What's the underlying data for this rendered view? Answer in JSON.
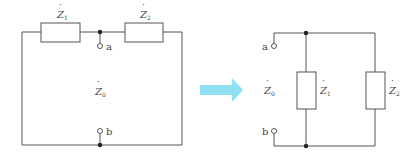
{
  "diagram": {
    "left_circuit": {
      "components": [
        {
          "name": "Z1",
          "symbol": "Z",
          "subscript": "1"
        },
        {
          "name": "Z2",
          "symbol": "Z",
          "subscript": "2"
        }
      ],
      "terminals": [
        "a",
        "b"
      ],
      "equivalent_label": {
        "symbol": "Z",
        "subscript": "0"
      }
    },
    "arrow": {
      "direction": "right",
      "color": "#8fe0f2"
    },
    "right_circuit": {
      "components": [
        {
          "name": "Z1",
          "symbol": "Z",
          "subscript": "1"
        },
        {
          "name": "Z2",
          "symbol": "Z",
          "subscript": "2"
        }
      ],
      "terminals": [
        "a",
        "b"
      ],
      "equivalent_label": {
        "symbol": "Z",
        "subscript": "0"
      }
    }
  }
}
